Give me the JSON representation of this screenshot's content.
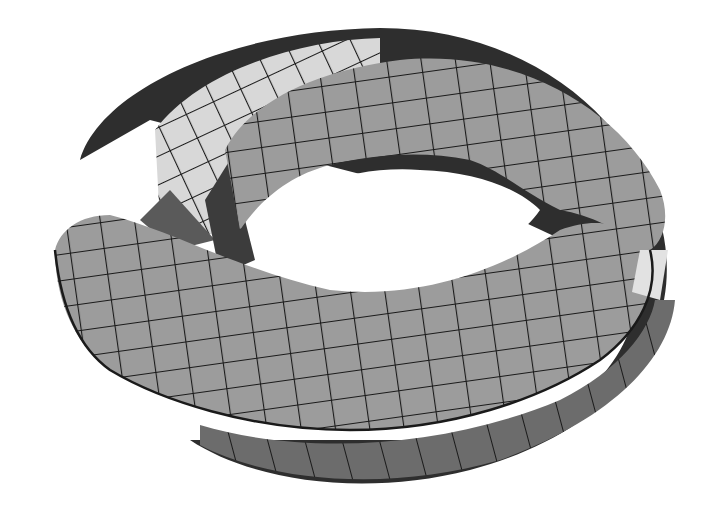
{
  "figure": {
    "colors": {
      "background": "#ffffff",
      "surface_mid": "#9a9a9a",
      "surface_light": "#d6d6d6",
      "surface_dark": "#6e6e6e",
      "edge_shadow": "#2e2e2e",
      "grid_line": "#1a1a1a"
    }
  }
}
